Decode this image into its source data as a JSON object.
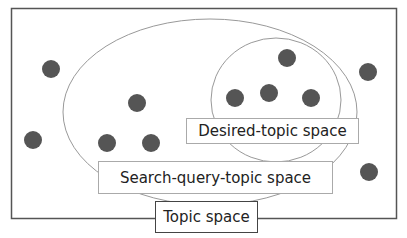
{
  "diagram": {
    "type": "venn-like nested sets",
    "colors": {
      "dot": "#555555",
      "outer_border": "#555555",
      "ellipse_stroke": "#999999"
    },
    "labels": {
      "desired_topic_space": "Desired-topic space",
      "search_query_topic_space": "Search-query-topic space",
      "topic_space": "Topic space"
    },
    "regions": [
      {
        "name": "Topic space",
        "shape": "rectangle",
        "contains_dots": 11
      },
      {
        "name": "Search-query-topic space",
        "shape": "ellipse",
        "contains_dots": 5
      },
      {
        "name": "Desired-topic space",
        "shape": "ellipse",
        "contains_dots": 4
      }
    ],
    "dots": [
      {
        "x": 51,
        "y": 69
      },
      {
        "x": 137,
        "y": 103
      },
      {
        "x": 33,
        "y": 140
      },
      {
        "x": 107,
        "y": 143
      },
      {
        "x": 151,
        "y": 143
      },
      {
        "x": 287,
        "y": 58
      },
      {
        "x": 269,
        "y": 93
      },
      {
        "x": 235,
        "y": 98
      },
      {
        "x": 311,
        "y": 98
      },
      {
        "x": 368,
        "y": 72
      },
      {
        "x": 369,
        "y": 172
      }
    ]
  }
}
